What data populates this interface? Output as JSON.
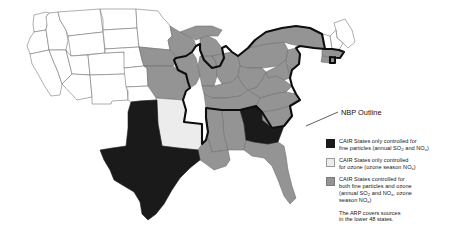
{
  "figure": {
    "type": "choropleth-map",
    "region": "United States (lower 48 states)",
    "annotation_label": "NBP Outline"
  },
  "legend": {
    "items": [
      {
        "swatch": "black",
        "color": "#1a1a1a",
        "line1": "CAIR States only controlled for",
        "line2_pre": "fine particles (annual SO",
        "line2_sub1": "2",
        "line2_mid": " and NO",
        "line2_sub2": "x",
        "line2_post": ")"
      },
      {
        "swatch": "light",
        "color": "#ececec",
        "line1": "CAIR States only controlled",
        "line2_pre": "for ozone (ozone season NO",
        "line2_sub1": "x",
        "line2_post": ")"
      },
      {
        "swatch": "gray",
        "color": "#949494",
        "line1": "CAIR States controlled for",
        "line2": "both fine particles and ozone",
        "line3_pre": "(annual SO",
        "line3_sub1": "2",
        "line3_mid": " and NO",
        "line3_sub2": "x",
        "line3_post": ", ozone",
        "line4_pre": "season NO",
        "line4_sub1": "x",
        "line4_post": ")"
      }
    ],
    "note_line1": "The ARP covers sources",
    "note_line2": "in the lower 48 states."
  },
  "map_data": {
    "categories": {
      "black": "CAIR States only controlled for fine particles (annual SO2 and NOx)",
      "light": "CAIR States only controlled for ozone (ozone season NOx)",
      "gray": "CAIR States controlled for both fine particles and ozone (annual SO2 and NOx, ozone season NOx)",
      "white": "Not a CAIR State"
    },
    "states_black": [
      "Texas",
      "Georgia"
    ],
    "states_light": [
      "Arkansas"
    ],
    "states_gray": [
      "Wisconsin",
      "Michigan",
      "Illinois",
      "Indiana",
      "Ohio",
      "Pennsylvania",
      "New York",
      "New Jersey",
      "Delaware",
      "Maryland",
      "Virginia",
      "West Virginia",
      "Kentucky",
      "Tennessee",
      "North Carolina",
      "South Carolina",
      "Alabama",
      "Mississippi",
      "Louisiana",
      "Florida",
      "Missouri",
      "Iowa",
      "Massachusetts",
      "Connecticut",
      "Rhode Island"
    ],
    "states_white": [
      "Washington",
      "Oregon",
      "California",
      "Idaho",
      "Nevada",
      "Montana",
      "Wyoming",
      "Utah",
      "Arizona",
      "Colorado",
      "New Mexico",
      "North Dakota",
      "South Dakota",
      "Nebraska",
      "Kansas",
      "Oklahoma",
      "Minnesota",
      "Maine",
      "New Hampshire",
      "Vermont"
    ]
  },
  "colors": {
    "black": "#1a1a1a",
    "light_gray": "#ececec",
    "gray": "#949494",
    "white": "#ffffff",
    "border": "#6d6d6d",
    "nbp_outline": "#0d0d0d"
  }
}
